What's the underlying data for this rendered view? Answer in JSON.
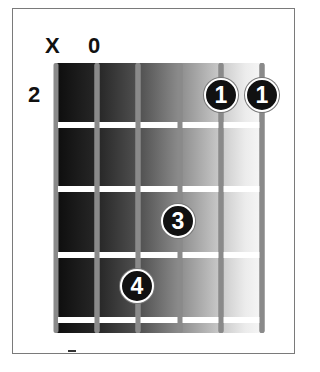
{
  "chord_diagram": {
    "string_markers": [
      {
        "string": 6,
        "marker": "X",
        "meaning": "muted"
      },
      {
        "string": 5,
        "marker": "0",
        "meaning": "open"
      }
    ],
    "start_fret_label": "2",
    "num_strings": 6,
    "num_frets_shown": 4,
    "fingers": [
      {
        "label": "1",
        "string": 2,
        "fret": 1
      },
      {
        "label": "1",
        "string": 1,
        "fret": 1
      },
      {
        "label": "3",
        "string": 3,
        "fret": 2
      },
      {
        "label": "4",
        "string": 4,
        "fret": 3
      }
    ],
    "colors": {
      "finger_fill": "#111111",
      "finger_text": "#ffffff",
      "string": "#8a8a8a",
      "fret": "#ffffff",
      "gradient_dark": "#0d0d0d",
      "gradient_light": "#f6f6f6"
    }
  }
}
